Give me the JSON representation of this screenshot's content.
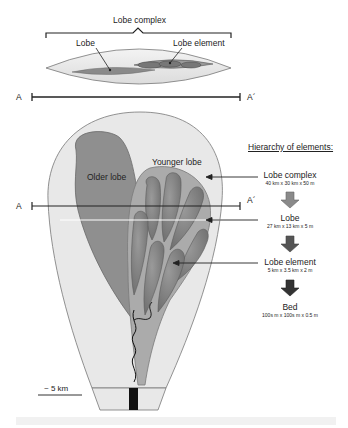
{
  "cross_section": {
    "title": "Lobe complex",
    "labels": {
      "lobe": "Lobe",
      "lobe_element": "Lobe element"
    },
    "section_line": {
      "start": "A",
      "end": "A´"
    }
  },
  "plan_view": {
    "labels": {
      "older_lobe": "Older lobe",
      "younger_lobe": "Younger lobe"
    },
    "section_line": {
      "start": "A",
      "end": "A´"
    },
    "scale_bar": "~ 5 km"
  },
  "hierarchy": {
    "title": "Hierarchy of elements:",
    "levels": [
      {
        "name": "Lobe complex",
        "dimensions": "40 km x 30 km x 50 m"
      },
      {
        "name": "Lobe",
        "dimensions": "27 km x 13 km x 5 m"
      },
      {
        "name": "Lobe element",
        "dimensions": "5 km x 3.5 km x 2 m"
      },
      {
        "name": "Bed",
        "dimensions": "100s m x 100s m x 0.5 m"
      }
    ]
  },
  "colors": {
    "complex_fill": "#e6e6e6",
    "older_lobe_fill": "#8d8d8d",
    "younger_lobe_fill": "#a9a9a9",
    "element_fill": "#7a7a7a",
    "arrow_light": "#8a8a8a",
    "arrow_dark": "#3a3a3a"
  }
}
